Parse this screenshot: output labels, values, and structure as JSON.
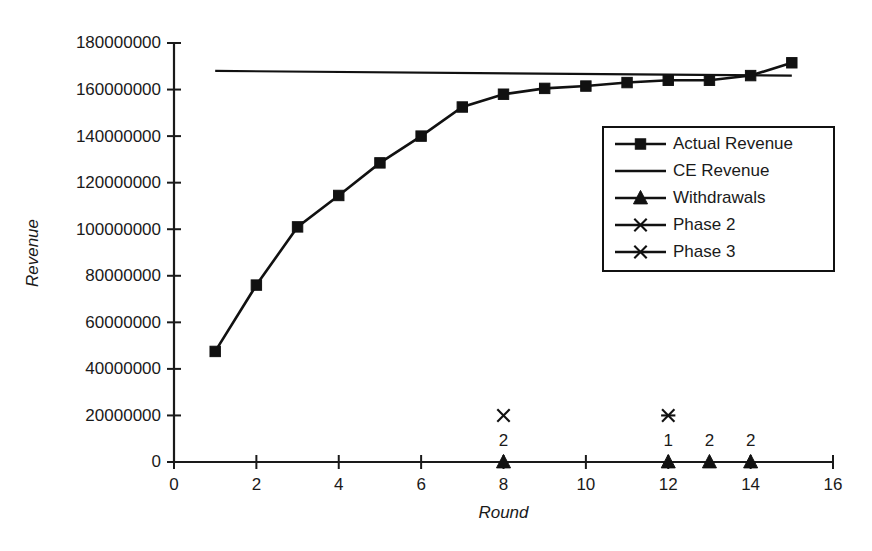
{
  "chart_data": {
    "type": "line",
    "title": "",
    "subtitle": "",
    "xlabel": "Round",
    "ylabel": "Revenue",
    "xlim": [
      0,
      16
    ],
    "ylim": [
      0,
      180000000
    ],
    "xticks": [
      0,
      2,
      4,
      6,
      8,
      10,
      12,
      14,
      16
    ],
    "xticklabels": [
      "0",
      "2",
      "4",
      "6",
      "8",
      "10",
      "12",
      "14",
      "16"
    ],
    "yticks": [
      0,
      20000000,
      40000000,
      60000000,
      80000000,
      100000000,
      120000000,
      140000000,
      160000000,
      180000000
    ],
    "yticklabels": [
      "0",
      "20000000",
      "40000000",
      "60000000",
      "80000000",
      "100000000",
      "120000000",
      "140000000",
      "160000000",
      "180000000"
    ],
    "grid": false,
    "legend_position": "center-right",
    "series": [
      {
        "name": "Actual Revenue",
        "marker": "square",
        "x": [
          1,
          2,
          3,
          4,
          5,
          6,
          7,
          8,
          9,
          10,
          11,
          12,
          13,
          14,
          15
        ],
        "values": [
          47500000,
          76000000,
          101000000,
          114500000,
          128500000,
          140000000,
          152500000,
          158000000,
          160500000,
          161500000,
          163000000,
          164000000,
          164000000,
          166000000,
          171500000
        ]
      },
      {
        "name": "CE Revenue",
        "marker": "none",
        "x": [
          1,
          15
        ],
        "values": [
          168000000,
          166000000
        ]
      },
      {
        "name": "Withdrawals",
        "marker": "triangle",
        "x": [
          8,
          12,
          13,
          14
        ],
        "values": [
          0,
          0,
          0,
          0
        ],
        "point_labels": [
          "2",
          "1",
          "2",
          "2"
        ]
      },
      {
        "name": "Phase 2",
        "marker": "x",
        "x": [
          8
        ],
        "values": [
          20000000
        ]
      },
      {
        "name": "Phase 3",
        "marker": "asterisk",
        "x": [
          12
        ],
        "values": [
          20000000
        ]
      }
    ],
    "legend_entries": [
      {
        "label": "Actual Revenue",
        "marker": "square"
      },
      {
        "label": "CE Revenue",
        "marker": "none"
      },
      {
        "label": "Withdrawals",
        "marker": "triangle"
      },
      {
        "label": "Phase 2",
        "marker": "x"
      },
      {
        "label": "Phase 3",
        "marker": "asterisk"
      }
    ],
    "colors": {
      "series": "#111111",
      "axis": "#1a1a1a",
      "background": "#ffffff"
    }
  }
}
